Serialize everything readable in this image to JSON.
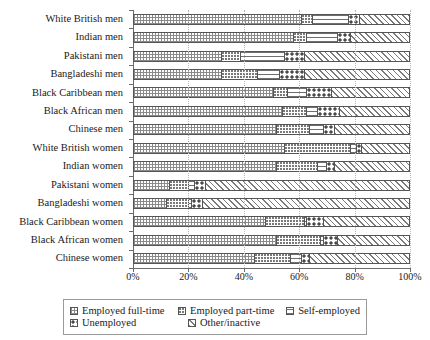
{
  "chart_data": {
    "type": "bar",
    "orientation": "horizontal",
    "stacked": true,
    "title": "",
    "xlabel": "",
    "ylabel": "",
    "xlim": [
      0,
      100
    ],
    "xticks": [
      "0%",
      "20%",
      "40%",
      "60%",
      "80%",
      "100%"
    ],
    "xtick_values": [
      0,
      20,
      40,
      60,
      80,
      100
    ],
    "grid": true,
    "legend_position": "bottom",
    "categories": [
      "White British men",
      "Indian men",
      "Pakistani men",
      "Bangladeshi men",
      "Black Caribbean men",
      "Black African men",
      "Chinese men",
      "White British women",
      "Indian women",
      "Pakistani women",
      "Bangladeshi women",
      "Black Caribbean women",
      "Black African women",
      "Chinese women"
    ],
    "series": [
      {
        "name": "Employed full-time",
        "pattern": "grid",
        "values": [
          61,
          58,
          32,
          32,
          51,
          54,
          52,
          55,
          52,
          13,
          12,
          48,
          52,
          44
        ]
      },
      {
        "name": "Employed part-time",
        "pattern": "small-dots",
        "values": [
          4,
          5,
          7,
          13,
          5,
          9,
          12,
          24,
          15,
          7,
          8,
          14,
          16,
          13
        ]
      },
      {
        "name": "Self-employed",
        "pattern": "horizontal-lines",
        "values": [
          13,
          11,
          16,
          8,
          7,
          4,
          5,
          2,
          3,
          2,
          1,
          1,
          1,
          4
        ]
      },
      {
        "name": "Unemployed",
        "pattern": "large-dots",
        "values": [
          4,
          5,
          7,
          9,
          9,
          8,
          4,
          2,
          3,
          4,
          4,
          6,
          5,
          3
        ]
      },
      {
        "name": "Other/inactive",
        "pattern": "diagonal-stripes",
        "values": [
          18,
          21,
          38,
          38,
          28,
          25,
          27,
          17,
          27,
          74,
          75,
          31,
          26,
          36
        ]
      }
    ]
  },
  "legend": {
    "items": [
      {
        "label": "Employed full-time"
      },
      {
        "label": "Employed part-time"
      },
      {
        "label": "Self-employed"
      },
      {
        "label": "Unemployed"
      },
      {
        "label": "Other/inactive"
      }
    ]
  }
}
